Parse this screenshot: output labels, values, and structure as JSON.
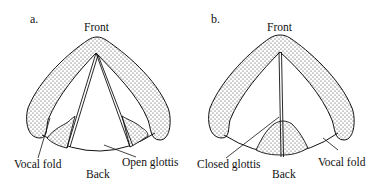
{
  "figure": {
    "panels": [
      {
        "id": "a",
        "label": "a.",
        "front_label": "Front",
        "back_label": "Back",
        "left_annotation": "Vocal fold",
        "right_annotation": "Open glottis",
        "state": "open"
      },
      {
        "id": "b",
        "label": "b.",
        "front_label": "Front",
        "back_label": "Back",
        "left_annotation": "Closed glottis",
        "right_annotation": "Vocal fold",
        "state": "closed"
      }
    ],
    "colors": {
      "stroke": "#111111",
      "fill": "#ffffff",
      "stipple": "#333333"
    }
  }
}
